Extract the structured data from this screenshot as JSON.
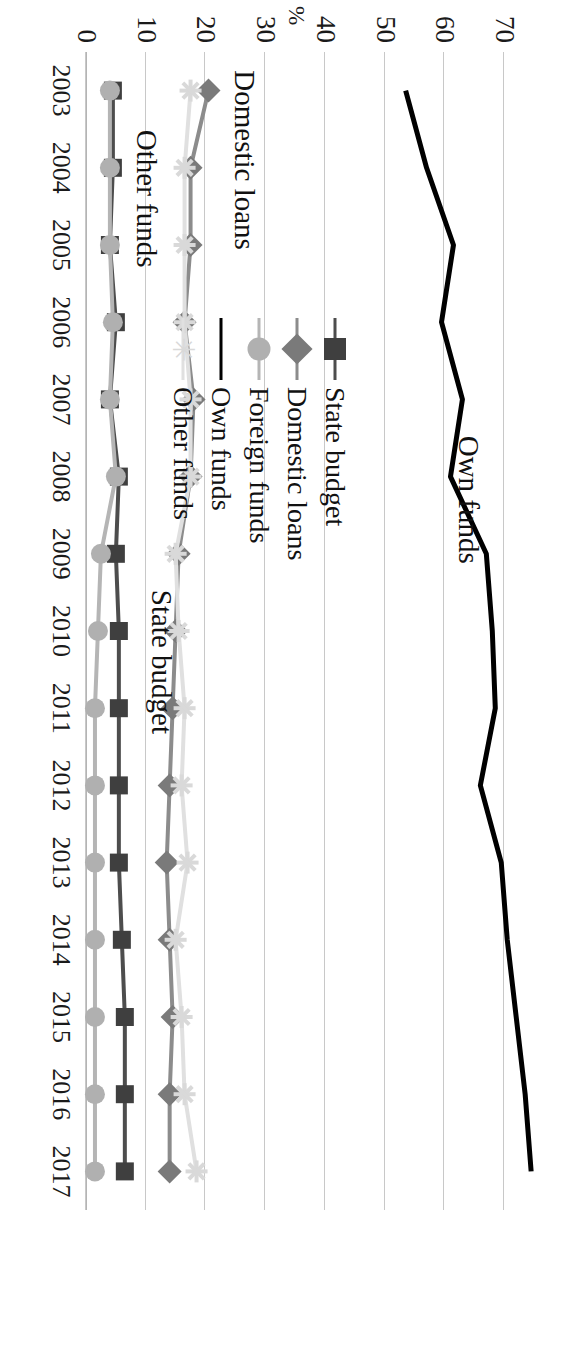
{
  "chart_data": {
    "type": "line",
    "title": "",
    "xlabel": "",
    "ylabel": "%",
    "ylim": [
      0,
      80
    ],
    "yticks": [
      0,
      10,
      20,
      30,
      40,
      50,
      60,
      70
    ],
    "grid": true,
    "legend_position": "center-left-inside",
    "x": [
      2003,
      2004,
      2005,
      2006,
      2007,
      2008,
      2009,
      2010,
      2011,
      2012,
      2013,
      2014,
      2015,
      2016,
      2017
    ],
    "categories": [
      "2003",
      "2004",
      "2005",
      "2006",
      "2007",
      "2008",
      "2009",
      "2010",
      "2011",
      "2012",
      "2013",
      "2014",
      "2015",
      "2016",
      "2017"
    ],
    "series": [
      {
        "name": "State budget",
        "color": "#4d4d4d",
        "marker": "square",
        "marker_color": "#3f3f3f",
        "values": [
          4.5,
          4.5,
          4.0,
          5.0,
          4.0,
          5.5,
          5.0,
          5.5,
          5.5,
          5.5,
          5.5,
          6.0,
          6.5,
          6.5,
          6.5
        ]
      },
      {
        "name": "Domestic loans",
        "color": "#8c8c8c",
        "marker": "diamond",
        "marker_color": "#7a7a7a",
        "values": [
          20.5,
          17.5,
          17.5,
          16.5,
          18.0,
          17.5,
          15.5,
          15.0,
          14.5,
          14.0,
          13.5,
          14.0,
          14.5,
          14.0,
          14.0
        ]
      },
      {
        "name": "Foreign funds",
        "color": "#b5b5b5",
        "marker": "circle",
        "marker_color": "#b0b0b0",
        "values": [
          4.0,
          4.0,
          4.0,
          4.5,
          4.0,
          5.0,
          2.5,
          2.0,
          1.5,
          1.5,
          1.5,
          1.5,
          1.5,
          1.5,
          1.5
        ]
      },
      {
        "name": "Own funds",
        "color": "#000000",
        "marker": "none",
        "marker_color": "#000000",
        "values": [
          53.5,
          57.0,
          61.5,
          59.5,
          63.0,
          61.0,
          67.0,
          68.0,
          68.5,
          66.0,
          69.5,
          70.5,
          72.0,
          73.5,
          74.5
        ]
      },
      {
        "name": "Other funds",
        "color": "#e0e0e0",
        "marker": "star",
        "marker_color": "#d9d9d9",
        "values": [
          17.5,
          16.5,
          16.5,
          16.5,
          17.5,
          17.5,
          15.0,
          15.5,
          16.5,
          16.0,
          17.0,
          15.0,
          16.0,
          16.5,
          18.5
        ]
      }
    ],
    "annotations": [
      {
        "text": "Own funds",
        "x": 2008.3,
        "y": 64.0
      },
      {
        "text": "State budget",
        "x": 2010.4,
        "y": 12.5
      },
      {
        "text": "Domestic loans",
        "x": 2003.9,
        "y": 26.5
      },
      {
        "text": "Other funds",
        "x": 2004.4,
        "y": 10.0
      }
    ]
  },
  "legend": {
    "items": [
      {
        "label": "State budget",
        "marker": "square",
        "color": "#4d4d4d",
        "marker_color": "#3f3f3f"
      },
      {
        "label": "Domestic loans",
        "marker": "diamond",
        "color": "#8c8c8c",
        "marker_color": "#7a7a7a"
      },
      {
        "label": "Foreign funds",
        "marker": "circle",
        "color": "#b5b5b5",
        "marker_color": "#b0b0b0"
      },
      {
        "label": "Own funds",
        "marker": "none",
        "color": "#000000",
        "marker_color": "#000000"
      },
      {
        "label": "Other funds",
        "marker": "star",
        "color": "#e0e0e0",
        "marker_color": "#d9d9d9"
      }
    ]
  }
}
